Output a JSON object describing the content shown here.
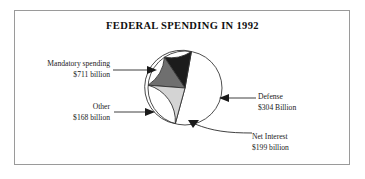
{
  "figure": {
    "title": "FEDERAL SPENDING IN 1992",
    "border_color": "#9a9a9a",
    "background": "#ffffff"
  },
  "callouts": {
    "mandatory": {
      "label": "Mandatory spending",
      "value": "$711 billion"
    },
    "other": {
      "label": "Other",
      "value": "$168 billion"
    },
    "defense": {
      "label": "Defense",
      "value": "$304 Billion"
    },
    "net_interest": {
      "label": "Net Interest",
      "value": "$199 billion"
    }
  },
  "chart_data": {
    "type": "pie",
    "title": "FEDERAL SPENDING IN 1992",
    "xlabel": "",
    "ylabel": "",
    "unit": "billions of US dollars",
    "total": 1382,
    "legend": "none (direct callout labels with arrows)",
    "grid": false,
    "start_angle_deg": 80,
    "direction": "counterclockwise",
    "categories": [
      "Mandatory spending",
      "Defense",
      "Net Interest",
      "Other"
    ],
    "values": [
      711,
      304,
      199,
      168
    ],
    "value_labels": [
      "$711 billion",
      "$304 Billion",
      "$199 billion",
      "$168 billion"
    ],
    "percentages": [
      51.4,
      22.0,
      14.4,
      12.2
    ],
    "colors": [
      "#ffffff",
      "#d4d4d4",
      "#6f6f6f",
      "#1c1c1c"
    ],
    "slice_edge_color": "#333333",
    "slices": [
      {
        "name": "Mandatory spending",
        "value": 711,
        "label": "$711 billion",
        "percent": 51.4,
        "color": "#ffffff"
      },
      {
        "name": "Defense",
        "value": 304,
        "label": "$304 Billion",
        "percent": 22.0,
        "color": "#d4d4d4"
      },
      {
        "name": "Net Interest",
        "value": 199,
        "label": "$199 billion",
        "percent": 14.4,
        "color": "#6f6f6f"
      },
      {
        "name": "Other",
        "value": 168,
        "label": "$168 billion",
        "percent": 12.2,
        "color": "#1c1c1c"
      }
    ]
  }
}
